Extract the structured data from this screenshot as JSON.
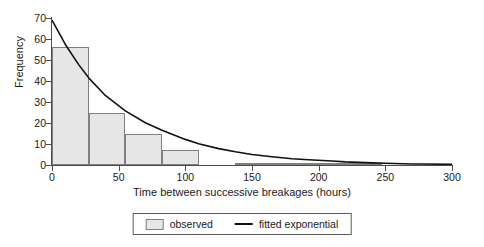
{
  "chart_data": {
    "type": "bar",
    "title": "",
    "xlabel": "Time between successive breakages (hours)",
    "ylabel": "Frequency",
    "xlim": [
      0,
      300
    ],
    "ylim": [
      0,
      70
    ],
    "xticks": [
      0,
      50,
      100,
      150,
      200,
      250,
      300
    ],
    "yticks": [
      0,
      10,
      20,
      30,
      40,
      50,
      60,
      70
    ],
    "grid": false,
    "legend_position": "bottom",
    "bin_width": 27.5,
    "categories": [
      "0-27.5",
      "27.5-55",
      "55-82.5",
      "82.5-110",
      "110-137.5",
      "137.5-165",
      "165-192.5",
      "192.5-220",
      "220-247.5",
      "247.5-275"
    ],
    "bin_edges": [
      0,
      27.5,
      55,
      82.5,
      110,
      137.5,
      165,
      192.5,
      220,
      247.5,
      275
    ],
    "series": [
      {
        "name": "observed",
        "type": "bar",
        "values": [
          56,
          25,
          15,
          7,
          0,
          1,
          1,
          1,
          1,
          0
        ]
      },
      {
        "name": "fitted exponential",
        "type": "line",
        "x": [
          0,
          10,
          20,
          27.5,
          40,
          55,
          70,
          82.5,
          100,
          110,
          125,
          137.5,
          150,
          165,
          180,
          192.5,
          210,
          220,
          240,
          250,
          270,
          275,
          300
        ],
        "y": [
          69.0,
          57.4,
          47.8,
          41.5,
          33.1,
          25.8,
          20.1,
          16.5,
          12.2,
          10.1,
          7.8,
          6.3,
          5.0,
          3.9,
          3.0,
          2.5,
          1.9,
          1.5,
          1.0,
          0.8,
          0.5,
          0.5,
          0.3
        ]
      }
    ]
  },
  "legend": {
    "items": [
      {
        "label": "observed",
        "marker": "box-swatch",
        "color": "#e6e6e6"
      },
      {
        "label": "fitted exponential",
        "marker": "line-swatch",
        "color": "#111111"
      }
    ]
  },
  "colors": {
    "bar_fill": "#e6e6e6",
    "bar_stroke": "#808080",
    "curve": "#111111",
    "axis": "#4d4d4d",
    "text": "#1a1a1a",
    "background": "#ffffff"
  }
}
